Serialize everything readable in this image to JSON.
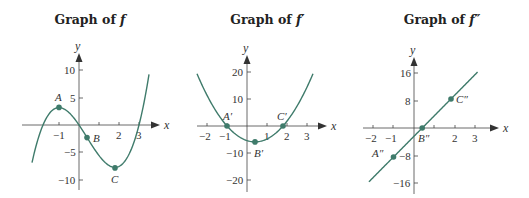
{
  "colors": {
    "curve": "#3f7b6b",
    "axis": "#444444",
    "point": "#3f7b6b",
    "text": "#333333"
  },
  "chart_data": [
    {
      "type": "line",
      "title": "Graph of f",
      "title_prefix": "Graph of ",
      "title_fn": "f",
      "xlabel": "x",
      "ylabel": "y",
      "function": "f(x) = x^3 - 1.2x^2 - 5.4x",
      "xlim": [
        -2.35,
        3.5
      ],
      "ylim": [
        -10,
        10
      ],
      "x_ticks": [
        -1,
        2,
        3
      ],
      "x_tick_marks": [
        -1,
        1,
        2,
        3
      ],
      "y_ticks": [
        10,
        5,
        -5,
        -10
      ],
      "y_tick_labels": [
        "10",
        "5",
        "−5",
        "−10"
      ],
      "x_tick_labels": [
        "−1",
        "2",
        "3"
      ],
      "points": [
        {
          "label": "A",
          "x": -1,
          "y": 3.2
        },
        {
          "label": "B",
          "x": 0.4,
          "y": -2.3
        },
        {
          "label": "C",
          "x": 1.8,
          "y": -7.8
        }
      ]
    },
    {
      "type": "line",
      "title": "Graph of f′",
      "title_prefix": "Graph of ",
      "title_fn": "f′",
      "xlabel": "x",
      "ylabel": "y",
      "function": "f'(x) = 3x^2 - 2.4x - 5.4",
      "xlim": [
        -2.5,
        3.3
      ],
      "ylim": [
        -20,
        20
      ],
      "x_ticks": [
        -2,
        -1,
        1,
        2,
        3
      ],
      "x_tick_labels": [
        "−2",
        "−1",
        "1",
        "2",
        "3"
      ],
      "y_ticks": [
        20,
        10,
        -10,
        -20
      ],
      "y_tick_labels": [
        "20",
        "10",
        "−10",
        "−20"
      ],
      "points": [
        {
          "label": "A′",
          "x": -1,
          "y": 0
        },
        {
          "label": "B′",
          "x": 0.4,
          "y": -5.9
        },
        {
          "label": "C′",
          "x": 1.8,
          "y": 0
        }
      ]
    },
    {
      "type": "line",
      "title": "Graph of f″",
      "title_prefix": "Graph of ",
      "title_fn": "f″",
      "xlabel": "x",
      "ylabel": "y",
      "function": "f''(x) = 6x - 2.4",
      "xlim": [
        -2.2,
        3.1
      ],
      "ylim": [
        -16,
        16
      ],
      "x_ticks": [
        -2,
        -1,
        1,
        2,
        3
      ],
      "x_tick_labels": [
        "−2",
        "−1",
        "",
        "2",
        "3"
      ],
      "y_ticks": [
        16,
        8,
        -8,
        -16
      ],
      "y_tick_labels": [
        "16",
        "8",
        "−8",
        "−16"
      ],
      "points": [
        {
          "label": "A″",
          "x": -1,
          "y": -8.4
        },
        {
          "label": "B″",
          "x": 0.4,
          "y": 0
        },
        {
          "label": "C″",
          "x": 1.8,
          "y": 8.4
        }
      ]
    }
  ]
}
